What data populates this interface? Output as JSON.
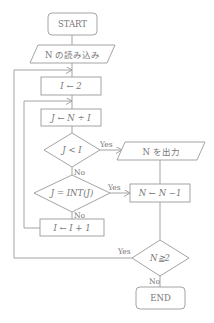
{
  "flowchart": {
    "nodes": {
      "start": {
        "type": "terminal",
        "label": "START"
      },
      "read_n": {
        "type": "io",
        "label": "N の読み込み"
      },
      "init_i": {
        "type": "process",
        "label": "I ← 2"
      },
      "calc_j": {
        "type": "process",
        "label": "J ← N ÷ I"
      },
      "cond_j_lt_i": {
        "type": "decision",
        "label": "J < I"
      },
      "output_n": {
        "type": "io",
        "label": "N を出力"
      },
      "cond_j_int": {
        "type": "decision",
        "label": "J = INT(J)"
      },
      "dec_n": {
        "type": "process",
        "label": "N ← N −1"
      },
      "inc_i": {
        "type": "process",
        "label": "I ← I + 1"
      },
      "cond_n_ge_2": {
        "type": "decision",
        "label": "N≧2"
      },
      "end": {
        "type": "terminal",
        "label": "END"
      }
    },
    "edge_labels": {
      "j_lt_i_yes": "Yes",
      "j_lt_i_no": "No",
      "j_int_yes": "Yes",
      "j_int_no": "No",
      "n_ge_2_yes": "Yes",
      "n_ge_2_no": "No"
    },
    "colors": {
      "stroke": "#9a9a9a",
      "text": "#777777",
      "background": "#ffffff"
    }
  }
}
